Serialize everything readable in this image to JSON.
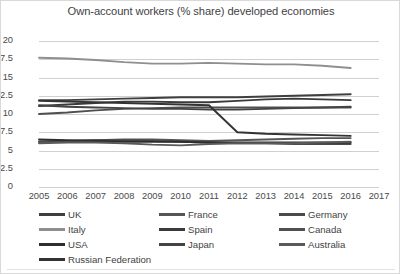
{
  "chart_data": {
    "type": "line",
    "title": "Own-account workers (% share) developed economies",
    "xlabel": "",
    "ylabel": "",
    "x": [
      2005,
      2006,
      2007,
      2008,
      2009,
      2010,
      2011,
      2012,
      2013,
      2014,
      2015,
      2016
    ],
    "xlim": [
      2005,
      2017
    ],
    "ylim": [
      0,
      20
    ],
    "yticks": [
      0,
      2.5,
      5,
      7.5,
      10,
      12.5,
      15,
      17.5,
      20
    ],
    "ytick_labels": [
      "0",
      "2.5",
      "5",
      "7.5",
      "10",
      "12.5",
      "15",
      "17.5",
      "20"
    ],
    "xtick_labels": [
      "2005",
      "2006",
      "2007",
      "2008",
      "2009",
      "2010",
      "2011",
      "2012",
      "2013",
      "2014",
      "2015",
      "2016",
      "2017"
    ],
    "grid": true,
    "legend_position": "bottom",
    "series": [
      {
        "name": "UK",
        "color": "#3f3f3f",
        "values": [
          11.9,
          11.9,
          12.0,
          12.1,
          12.2,
          12.3,
          12.3,
          12.3,
          12.4,
          12.5,
          12.6,
          12.7
        ]
      },
      {
        "name": "France",
        "color": "#555555",
        "values": [
          6.2,
          6.3,
          6.4,
          6.5,
          6.5,
          6.4,
          6.3,
          6.4,
          6.5,
          6.6,
          6.7,
          6.7
        ]
      },
      {
        "name": "Germany",
        "color": "#4a4a4a",
        "values": [
          6.2,
          6.3,
          6.4,
          6.4,
          6.3,
          6.2,
          6.1,
          6.0,
          6.0,
          5.9,
          5.9,
          5.9
        ]
      },
      {
        "name": "Italy",
        "color": "#8f8f8f",
        "values": [
          17.7,
          17.6,
          17.4,
          17.1,
          16.9,
          16.9,
          17.0,
          16.9,
          16.8,
          16.8,
          16.6,
          16.3
        ]
      },
      {
        "name": "Spain",
        "color": "#3a3a3a",
        "values": [
          11.1,
          11.3,
          11.5,
          11.7,
          11.7,
          11.6,
          11.6,
          11.8,
          12.0,
          12.1,
          12.0,
          11.9
        ]
      },
      {
        "name": "Canada",
        "color": "#4f4f4f",
        "values": [
          10.0,
          10.2,
          10.5,
          10.7,
          10.8,
          10.9,
          10.9,
          10.9,
          10.9,
          10.9,
          10.9,
          10.9
        ]
      },
      {
        "name": "USA",
        "color": "#2e2e2e",
        "values": [
          6.5,
          6.4,
          6.3,
          6.2,
          6.2,
          6.2,
          6.1,
          6.1,
          6.1,
          6.1,
          6.1,
          6.1
        ]
      },
      {
        "name": "Japan",
        "color": "#444444",
        "values": [
          11.2,
          11.0,
          10.9,
          10.8,
          10.7,
          10.7,
          10.6,
          10.6,
          10.7,
          10.8,
          10.9,
          11.0
        ]
      },
      {
        "name": "Australia",
        "color": "#5a5a5a",
        "values": [
          6.0,
          6.1,
          6.1,
          6.0,
          5.8,
          5.7,
          5.9,
          6.0,
          6.0,
          6.0,
          6.1,
          6.2
        ]
      },
      {
        "name": "Russian Federation",
        "color": "#333333",
        "values": [
          11.8,
          11.7,
          11.6,
          11.5,
          11.4,
          11.3,
          11.2,
          7.5,
          7.3,
          7.2,
          7.1,
          7.0
        ]
      }
    ]
  },
  "legend": {
    "items": [
      {
        "label": "UK"
      },
      {
        "label": "France"
      },
      {
        "label": "Germany"
      },
      {
        "label": "Italy"
      },
      {
        "label": "Spain"
      },
      {
        "label": "Canada"
      },
      {
        "label": "USA"
      },
      {
        "label": "Japan"
      },
      {
        "label": "Australia"
      },
      {
        "label": "Russian Federation"
      }
    ]
  }
}
